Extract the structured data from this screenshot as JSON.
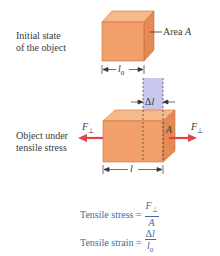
{
  "labels": {
    "initial_state_line1": "Initial state",
    "initial_state_line2": "of the object",
    "area": "Area A",
    "l0": "l0",
    "delta_l": "Δl",
    "under_stress_line1": "Object under",
    "under_stress_line2": "tensile stress",
    "force_left": "F⊥",
    "force_right": "F⊥",
    "face_A": "A",
    "length_l": "l"
  },
  "equations": {
    "stress_label": "Tensile stress =",
    "stress_num": "F⊥",
    "stress_den": "A",
    "strain_label": "Tensile strain =",
    "strain_num": "Δl",
    "strain_den": "l0"
  },
  "colors": {
    "cube_front": "#f2a06a",
    "cube_top": "#f7b98a",
    "cube_side": "#e58a52",
    "extension": "#c8c8ee",
    "force_arrow": "#e0424e",
    "equation_text": "#3a6ea8"
  }
}
